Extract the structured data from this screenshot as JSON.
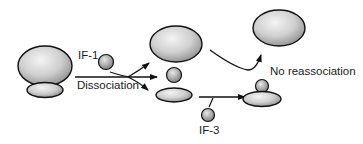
{
  "diagram": {
    "labels": {
      "if1": "IF-1",
      "dissociation": "Dissociation",
      "if3": "IF-3",
      "no_reassociation": "No reassociation"
    },
    "colors": {
      "fill_light": "#e6e6e6",
      "fill_dark": "#9a9a9a",
      "stroke": "#111111"
    },
    "nodes": [
      {
        "id": "ribosome-70s-large",
        "shape": "ellipse"
      },
      {
        "id": "ribosome-70s-small",
        "shape": "ellipse"
      },
      {
        "id": "if1-factor",
        "shape": "circle"
      },
      {
        "id": "large-subunit-mid",
        "shape": "ellipse"
      },
      {
        "id": "if1-mid",
        "shape": "circle"
      },
      {
        "id": "small-subunit-mid",
        "shape": "ellipse"
      },
      {
        "id": "if3-factor",
        "shape": "circle"
      },
      {
        "id": "large-subunit-free",
        "shape": "ellipse"
      },
      {
        "id": "small-subunit-if3",
        "shape": "ellipse"
      },
      {
        "id": "if3-bound",
        "shape": "circle"
      }
    ]
  }
}
